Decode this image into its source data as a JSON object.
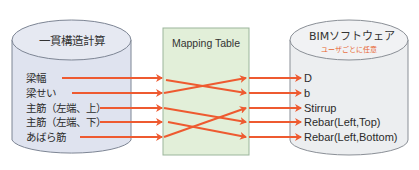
{
  "left_db": {
    "title": "一貫構造計算",
    "fields": [
      "梁幅",
      "梁せい",
      "主筋（左端、上）",
      "主筋（左端、下）",
      "あばら筋"
    ],
    "fill": "#dfe3ef",
    "stroke": "#7d8594"
  },
  "mapping_table": {
    "title": "Mapping Table",
    "fill": "#e2efd9",
    "stroke": "#9bb59b"
  },
  "right_db": {
    "title": "BIMソフトウェア",
    "subtitle": "ユーザごとに任意",
    "fields": [
      "D",
      "b",
      "Stirrup",
      "Rebar(Left,Top)",
      "Rebar(Left,Bottom)"
    ],
    "fill": "#eceef0",
    "stroke": "#8a8f96"
  },
  "mapping": [
    {
      "from": "梁幅",
      "to": "b"
    },
    {
      "from": "梁せい",
      "to": "D"
    },
    {
      "from": "主筋（左端、上）",
      "to": "Rebar(Left,Top)"
    },
    {
      "from": "主筋（左端、下）",
      "to": "Rebar(Left,Bottom)"
    },
    {
      "from": "あばら筋",
      "to": "Stirrup"
    }
  ],
  "colors": {
    "arrow": "#ee5a30",
    "subtitle": "#e8642e"
  }
}
